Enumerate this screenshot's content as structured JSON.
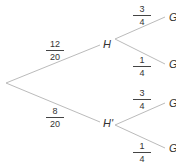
{
  "tree": {
    "root": "",
    "first_level": [
      {
        "node": "H",
        "prob_num": "12",
        "prob_den": "20"
      },
      {
        "node": "H'",
        "prob_num": "8",
        "prob_den": "20"
      }
    ],
    "second_level": [
      {
        "parent": "H",
        "node": "G",
        "prob_num": "3",
        "prob_den": "4"
      },
      {
        "parent": "H",
        "node": "G",
        "prob_num": "1",
        "prob_den": "4"
      },
      {
        "parent": "H'",
        "node": "G",
        "prob_num": "3",
        "prob_den": "4"
      },
      {
        "parent": "H'",
        "node": "G",
        "prob_num": "1",
        "prob_den": "4"
      }
    ]
  },
  "colors": {
    "line": "#bbbbbb",
    "text": "#333333"
  }
}
